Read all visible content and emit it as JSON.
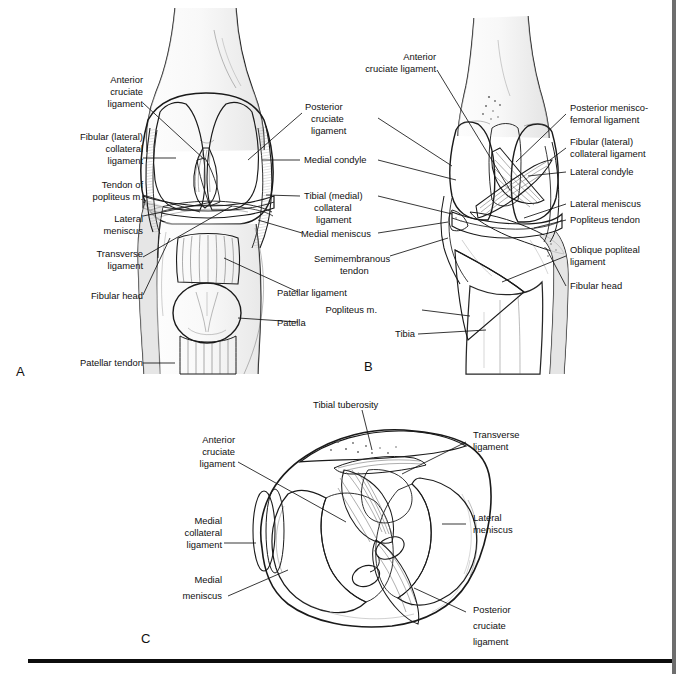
{
  "figure": {
    "panels": [
      {
        "letter": "A",
        "name": "anterior-view",
        "labels": [
          {
            "id": "a-acl",
            "text_lines": [
              "Anterior",
              "cruciate",
              "ligament"
            ],
            "side": "left"
          },
          {
            "id": "a-fcl",
            "text_lines": [
              "Fibular (lateral)",
              "collateral",
              "ligament"
            ],
            "side": "left"
          },
          {
            "id": "a-popliteus-tendon",
            "text_lines": [
              "Tendon of",
              "popliteus m."
            ],
            "side": "left"
          },
          {
            "id": "a-lateral-meniscus",
            "text_lines": [
              "Lateral",
              "meniscus"
            ],
            "side": "left"
          },
          {
            "id": "a-transverse-ligament",
            "text_lines": [
              "Transverse",
              "ligament"
            ],
            "side": "left"
          },
          {
            "id": "a-fibular-head",
            "text_lines": [
              "Fibular head"
            ],
            "side": "left"
          },
          {
            "id": "a-patellar-tendon",
            "text_lines": [
              "Patellar tendon"
            ],
            "side": "left"
          },
          {
            "id": "a-pcl",
            "text_lines": [
              "Posterior",
              "cruciate",
              "ligament"
            ],
            "side": "right"
          },
          {
            "id": "a-medial-condyle",
            "text_lines": [
              "Medial condyle"
            ],
            "side": "right"
          },
          {
            "id": "a-tcl",
            "text_lines": [
              "Tibial (medial)",
              "collateral",
              "ligament"
            ],
            "side": "right"
          },
          {
            "id": "a-medial-meniscus",
            "text_lines": [
              "Medial meniscus"
            ],
            "side": "right"
          },
          {
            "id": "a-patellar-ligament",
            "text_lines": [
              "Patellar ligament"
            ],
            "side": "right"
          },
          {
            "id": "a-patella",
            "text_lines": [
              "Patella"
            ],
            "side": "right"
          }
        ]
      },
      {
        "letter": "B",
        "name": "posterior-view",
        "labels": [
          {
            "id": "b-acl",
            "text_lines": [
              "Anterior",
              "cruciate ligament"
            ],
            "side": "left"
          },
          {
            "id": "b-semimembranous",
            "text_lines": [
              "Semimembranous",
              "tendon"
            ],
            "side": "left"
          },
          {
            "id": "b-popliteus-m",
            "text_lines": [
              "Popliteus m."
            ],
            "side": "left"
          },
          {
            "id": "b-tibia",
            "text_lines": [
              "Tibia"
            ],
            "side": "left"
          },
          {
            "id": "b-pmfl",
            "text_lines": [
              "Posterior menisco-",
              "femoral ligament"
            ],
            "side": "right"
          },
          {
            "id": "b-fcl",
            "text_lines": [
              "Fibular (lateral)",
              "collateral ligament"
            ],
            "side": "right"
          },
          {
            "id": "b-lateral-condyle",
            "text_lines": [
              "Lateral condyle"
            ],
            "side": "right"
          },
          {
            "id": "b-lateral-meniscus",
            "text_lines": [
              "Lateral meniscus"
            ],
            "side": "right"
          },
          {
            "id": "b-popliteus-tendon",
            "text_lines": [
              "Popliteus tendon"
            ],
            "side": "right"
          },
          {
            "id": "b-opl",
            "text_lines": [
              "Oblique popliteal",
              "ligament"
            ],
            "side": "right"
          },
          {
            "id": "b-fibular-head",
            "text_lines": [
              "Fibular head"
            ],
            "side": "right"
          }
        ]
      },
      {
        "letter": "C",
        "name": "superior-tibial-plateau-view",
        "labels": [
          {
            "id": "c-tibial-tuberosity",
            "text_lines": [
              "Tibial tuberosity"
            ],
            "side": "top"
          },
          {
            "id": "c-acl",
            "text_lines": [
              "Anterior",
              "cruciate",
              "ligament"
            ],
            "side": "left"
          },
          {
            "id": "c-mcl",
            "text_lines": [
              "Medial",
              "collateral",
              "ligament"
            ],
            "side": "left"
          },
          {
            "id": "c-medial-meniscus",
            "text_lines": [
              "Medial",
              "meniscus"
            ],
            "side": "left"
          },
          {
            "id": "c-transverse-ligament",
            "text_lines": [
              "Transverse",
              "ligament"
            ],
            "side": "right"
          },
          {
            "id": "c-lateral-meniscus",
            "text_lines": [
              "Lateral",
              "meniscus"
            ],
            "side": "right"
          },
          {
            "id": "c-pcl",
            "text_lines": [
              "Posterior",
              "cruciate",
              "ligament"
            ],
            "side": "right"
          }
        ]
      }
    ],
    "colors": {
      "background": "#ffffff",
      "ink": "#1a1a1a",
      "label_text": "#101010",
      "leader_line": "#141414",
      "bone_light": "#f2f2f2",
      "bone_mid": "#e2e2e2",
      "bone_shade": "#cfcfcf",
      "soft_tissue": "#d8d8d8",
      "muscle_dark": "#9a9a9a",
      "rule_bottom": "#0d0d0d",
      "rule_right": "#6e6e6e"
    },
    "rules": {
      "bottom_rule": "horizontal-black-rule",
      "right_rule": "vertical-gray-rule"
    }
  }
}
